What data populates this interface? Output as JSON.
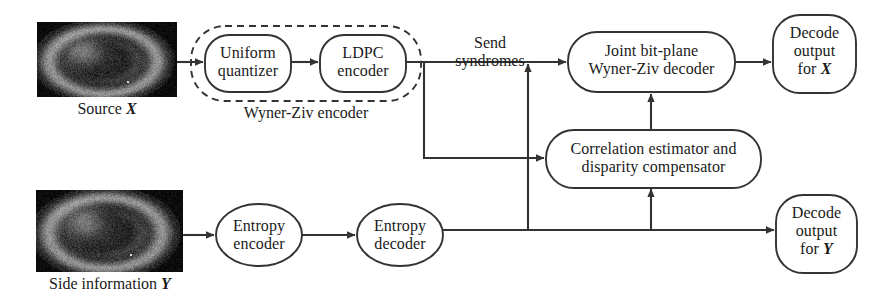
{
  "diagram": {
    "stroke_color": "#333333",
    "text_color": "#1a1a1a",
    "background": "#ffffff"
  },
  "images": [
    {
      "id": "source-image",
      "caption_plain": "Source X",
      "caption_text": "Source ",
      "caption_symbol": "X",
      "x": 37,
      "y": 22,
      "w": 140,
      "h": 75
    },
    {
      "id": "side-information-image",
      "caption_plain": "Side information Y",
      "caption_text": "Side information ",
      "caption_symbol": "Y",
      "x": 36,
      "y": 190,
      "w": 147,
      "h": 82
    }
  ],
  "nodes": [
    {
      "id": "uniform-quantizer",
      "lines": [
        "Uniform",
        "quantizer"
      ],
      "shape": "rounded-rect",
      "x": 205,
      "y": 35,
      "w": 86,
      "h": 57,
      "rx": 24
    },
    {
      "id": "ldpc-encoder",
      "lines": [
        "LDPC",
        "encoder"
      ],
      "shape": "rounded-rect",
      "x": 320,
      "y": 35,
      "w": 86,
      "h": 57,
      "rx": 24
    },
    {
      "id": "joint-bit-plane-wyner-ziv-decoder",
      "lines": [
        "Joint bit-plane",
        "Wyner-Ziv decoder"
      ],
      "shape": "rounded-rect",
      "x": 568,
      "y": 32,
      "w": 167,
      "h": 60,
      "rx": 28
    },
    {
      "id": "decode-output-for-x",
      "lines": [
        "Decode",
        "output",
        "for X"
      ],
      "line3_text": "for ",
      "line3_symbol": "X",
      "shape": "rounded-rect",
      "x": 773,
      "y": 15,
      "w": 83,
      "h": 78,
      "rx": 26
    },
    {
      "id": "correlation-estimator-and-disparity-compensator",
      "lines": [
        "Correlation estimator and",
        "disparity compensator"
      ],
      "shape": "rounded-rect",
      "x": 546,
      "y": 130,
      "w": 215,
      "h": 57,
      "rx": 27
    },
    {
      "id": "entropy-encoder",
      "lines": [
        "Entropy",
        "encoder"
      ],
      "shape": "ellipse",
      "x": 216,
      "y": 204,
      "w": 86,
      "h": 62
    },
    {
      "id": "entropy-decoder",
      "lines": [
        "Entropy",
        "decoder"
      ],
      "shape": "ellipse",
      "x": 357,
      "y": 204,
      "w": 86,
      "h": 62
    },
    {
      "id": "decode-output-for-y",
      "lines": [
        "Decode",
        "output",
        "for Y"
      ],
      "line3_text": "for ",
      "line3_symbol": "Y",
      "shape": "rounded-rect",
      "x": 776,
      "y": 195,
      "w": 81,
      "h": 78,
      "rx": 26
    }
  ],
  "group_box": {
    "id": "wyner-ziv-encoder-group",
    "label": "Wyner-Ziv encoder",
    "x": 191,
    "y": 26,
    "w": 230,
    "h": 75,
    "rx": 34,
    "style": "dashed"
  },
  "annotations": [
    {
      "id": "send-syndromes-label",
      "lines": [
        "Send",
        "syndromes"
      ],
      "x": 437,
      "y": 34,
      "w": 106
    }
  ]
}
